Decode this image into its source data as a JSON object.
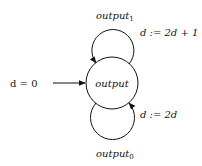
{
  "diagram": {
    "type": "state-machine",
    "states": [
      {
        "id": "output",
        "label": "output"
      }
    ],
    "initial": {
      "label": "d = 0",
      "target": "output"
    },
    "transitions": [
      {
        "from": "output",
        "to": "output",
        "position": "top",
        "output_label": "output",
        "output_subscript": "1",
        "action": "d := 2d + 1"
      },
      {
        "from": "output",
        "to": "output",
        "position": "bottom",
        "output_label": "output",
        "output_subscript": "0",
        "action": "d := 2d"
      }
    ]
  }
}
